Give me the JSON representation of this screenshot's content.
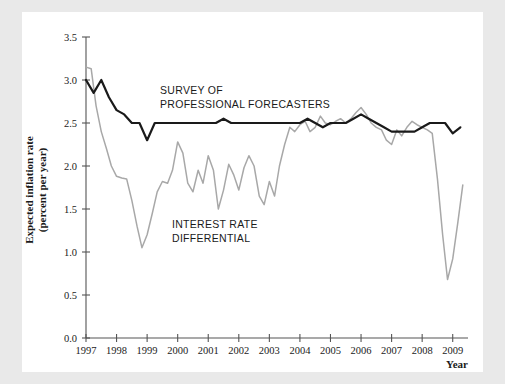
{
  "figure": {
    "background": "#ffffff",
    "page_background": "#e9e9e9"
  },
  "chart_data": {
    "type": "line",
    "title": "",
    "xlabel": "Year",
    "ylabel": "Expected inflation rate (percent per year)",
    "ylabel_line1": "Expected inflation rate",
    "ylabel_line2": "(percent per year)",
    "xlim": [
      1997.0,
      2009.5
    ],
    "ylim": [
      0.0,
      3.5
    ],
    "grid": false,
    "legend_position": "inline-annotations",
    "xticks": [
      1997,
      1998,
      1999,
      2000,
      2001,
      2002,
      2003,
      2004,
      2005,
      2006,
      2007,
      2008,
      2009
    ],
    "xtick_labels": [
      "1997",
      "1998",
      "1999",
      "2000",
      "2001",
      "2002",
      "2003",
      "2004",
      "2005",
      "2006",
      "2007",
      "2008",
      "2009"
    ],
    "yticks": [
      0.0,
      0.5,
      1.0,
      1.5,
      2.0,
      2.5,
      3.0,
      3.5
    ],
    "ytick_labels": [
      "0.0",
      "0.5",
      "1.0",
      "1.5",
      "2.0",
      "2.5",
      "3.0",
      "3.5"
    ],
    "series": [
      {
        "name": "SURVEY OF PROFESSIONAL FORECASTERS",
        "label_line1": "SURVEY OF",
        "label_line2": "PROFESSIONAL FORECASTERS",
        "color": "#1a1a1a",
        "x": [
          1997.0,
          1997.25,
          1997.5,
          1997.75,
          1998.0,
          1998.25,
          1998.5,
          1998.75,
          1999.0,
          1999.25,
          1999.5,
          1999.75,
          2000.0,
          2000.25,
          2000.5,
          2000.75,
          2001.0,
          2001.25,
          2001.5,
          2001.75,
          2002.0,
          2002.25,
          2002.5,
          2002.75,
          2003.0,
          2003.25,
          2003.5,
          2003.75,
          2004.0,
          2004.25,
          2004.5,
          2004.75,
          2005.0,
          2005.25,
          2005.5,
          2005.75,
          2006.0,
          2006.25,
          2006.5,
          2006.75,
          2007.0,
          2007.25,
          2007.5,
          2007.75,
          2008.0,
          2008.25,
          2008.5,
          2008.75,
          2009.0,
          2009.25
        ],
        "values": [
          3.0,
          2.85,
          3.0,
          2.8,
          2.65,
          2.6,
          2.5,
          2.5,
          2.3,
          2.5,
          2.5,
          2.5,
          2.5,
          2.5,
          2.5,
          2.5,
          2.5,
          2.5,
          2.55,
          2.5,
          2.5,
          2.5,
          2.5,
          2.5,
          2.5,
          2.5,
          2.5,
          2.5,
          2.5,
          2.55,
          2.5,
          2.45,
          2.5,
          2.5,
          2.5,
          2.55,
          2.6,
          2.55,
          2.5,
          2.45,
          2.4,
          2.4,
          2.4,
          2.4,
          2.45,
          2.5,
          2.5,
          2.5,
          2.38,
          2.45
        ]
      },
      {
        "name": "INTEREST RATE DIFFERENTIAL",
        "label_line1": "INTEREST RATE",
        "label_line2": "DIFFERENTIAL",
        "color": "#a8a8a8",
        "x": [
          1997.0,
          1997.17,
          1997.33,
          1997.5,
          1997.67,
          1997.83,
          1998.0,
          1998.17,
          1998.33,
          1998.5,
          1998.67,
          1998.83,
          1999.0,
          1999.17,
          1999.33,
          1999.5,
          1999.67,
          1999.83,
          2000.0,
          2000.17,
          2000.33,
          2000.5,
          2000.67,
          2000.83,
          2001.0,
          2001.17,
          2001.33,
          2001.5,
          2001.67,
          2001.83,
          2002.0,
          2002.17,
          2002.33,
          2002.5,
          2002.67,
          2002.83,
          2003.0,
          2003.17,
          2003.33,
          2003.5,
          2003.67,
          2003.83,
          2004.0,
          2004.17,
          2004.33,
          2004.5,
          2004.67,
          2004.83,
          2005.0,
          2005.17,
          2005.33,
          2005.5,
          2005.67,
          2005.83,
          2006.0,
          2006.17,
          2006.33,
          2006.5,
          2006.67,
          2006.83,
          2007.0,
          2007.17,
          2007.33,
          2007.5,
          2007.67,
          2007.83,
          2008.0,
          2008.17,
          2008.33,
          2008.5,
          2008.67,
          2008.83,
          2009.0,
          2009.17,
          2009.33
        ],
        "values": [
          3.15,
          3.13,
          2.7,
          2.4,
          2.2,
          2.0,
          1.88,
          1.86,
          1.85,
          1.6,
          1.3,
          1.05,
          1.2,
          1.45,
          1.7,
          1.82,
          1.8,
          1.95,
          2.28,
          2.15,
          1.8,
          1.7,
          1.95,
          1.8,
          2.12,
          1.95,
          1.5,
          1.72,
          2.02,
          1.9,
          1.72,
          1.98,
          2.12,
          2.0,
          1.65,
          1.55,
          1.82,
          1.65,
          2.0,
          2.25,
          2.45,
          2.4,
          2.48,
          2.52,
          2.4,
          2.45,
          2.58,
          2.5,
          2.48,
          2.52,
          2.55,
          2.5,
          2.55,
          2.62,
          2.68,
          2.6,
          2.5,
          2.45,
          2.42,
          2.3,
          2.25,
          2.42,
          2.35,
          2.45,
          2.52,
          2.48,
          2.45,
          2.42,
          2.38,
          1.85,
          1.2,
          0.68,
          0.92,
          1.35,
          1.78
        ]
      }
    ]
  }
}
